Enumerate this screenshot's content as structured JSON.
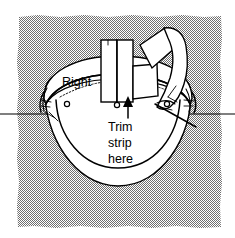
{
  "figure": {
    "kind": "line-illustration",
    "canvas": {
      "width": 235,
      "height": 238
    },
    "background": {
      "name": "stipple-texture",
      "pattern": "checkerboard-stipple",
      "color": "#8a8a8a",
      "paper_color": "#ffffff",
      "region": {
        "x": 17,
        "y": 15,
        "width": 205,
        "height": 213
      }
    },
    "labels": {
      "right": "Right",
      "trim_line_1": "Trim",
      "trim_line_2": "strip",
      "trim_line_3": "here"
    },
    "annotations": {
      "arrow": {
        "name": "trim-arrow",
        "direction": "up",
        "tip": {
          "x": 128,
          "y": 99
        },
        "tail": {
          "x": 128,
          "y": 117
        }
      },
      "horizon_line": {
        "name": "horizontal-reference-line",
        "y": 114,
        "from_x": 0,
        "to_x": 235
      }
    },
    "eyelets": [
      {
        "cx": 67,
        "cy": 104,
        "r": 2.6
      },
      {
        "cx": 117,
        "cy": 105,
        "r": 2.6
      },
      {
        "cx": 167,
        "cy": 104,
        "r": 2.6
      }
    ],
    "colors": {
      "ink": "#000000",
      "paper": "#ffffff",
      "stipple": "#8a8a8a"
    }
  }
}
